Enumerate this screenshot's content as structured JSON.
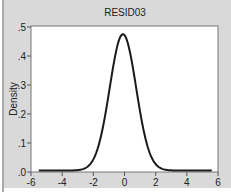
{
  "chart_data": {
    "type": "line",
    "title": "RESID03",
    "xlabel": "",
    "ylabel": "Density",
    "xlim": [
      -6,
      6
    ],
    "ylim": [
      0,
      0.5
    ],
    "x_ticks": [
      -6,
      -4,
      -2,
      0,
      2,
      4,
      6
    ],
    "x_tick_labels": [
      "-6",
      "-4",
      "-2",
      "0",
      "2",
      "4",
      "6"
    ],
    "y_ticks": [
      0,
      0.1,
      0.2,
      0.3,
      0.4,
      0.5
    ],
    "y_tick_labels": [
      ".0",
      ".1",
      ".2",
      ".3",
      ".4",
      ".5"
    ],
    "grid": false,
    "legend": null,
    "series": [
      {
        "name": "RESID03 density",
        "description": "Kernel density estimate, approximately normal shaped",
        "peak_x": -0.1,
        "peak_y": 0.47,
        "std_estimate": 0.85,
        "x_range": [
          -5.5,
          5.6
        ],
        "x": [
          -5.5,
          -4,
          -3,
          -2.5,
          -2,
          -1.5,
          -1,
          -0.5,
          -0.1,
          0.5,
          1,
          1.5,
          2,
          2.5,
          3,
          4,
          5.6
        ],
        "y": [
          0.0,
          0.0,
          0.002,
          0.008,
          0.035,
          0.106,
          0.221,
          0.387,
          0.47,
          0.337,
          0.189,
          0.079,
          0.024,
          0.005,
          0.001,
          0.0,
          0.0
        ]
      }
    ],
    "colors": {
      "background": "#d9d9d9",
      "plot_area": "#ffffff",
      "line": "#1a1a1a",
      "axis": "#555555"
    }
  }
}
